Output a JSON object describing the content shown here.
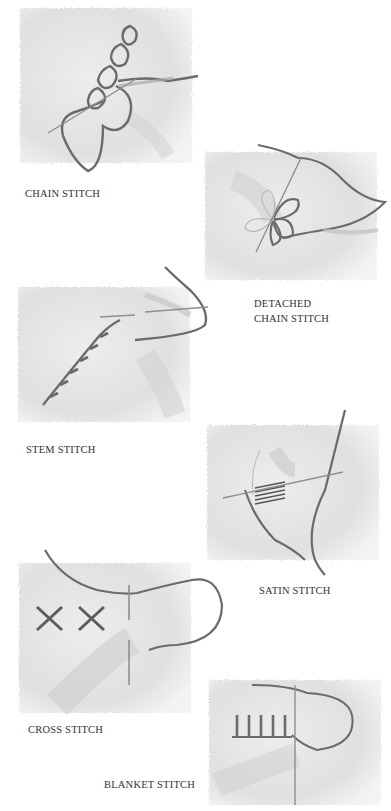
{
  "stitches": [
    {
      "id": "chain",
      "label": "CHAIN STITCH"
    },
    {
      "id": "detached-chain",
      "label_line1": "DETACHED",
      "label_line2": "CHAIN STITCH"
    },
    {
      "id": "stem",
      "label": "STEM STITCH"
    },
    {
      "id": "satin",
      "label": "SATIN STITCH"
    },
    {
      "id": "cross",
      "label": "CROSS STITCH"
    },
    {
      "id": "blanket",
      "label": "BLANKET STITCH"
    }
  ],
  "colors": {
    "fabric": "#e4e4e4",
    "fabric_shadow": "#cfcfcf",
    "thread": "#6b6b6b",
    "needle": "#9a9a9a",
    "text": "#333333"
  }
}
